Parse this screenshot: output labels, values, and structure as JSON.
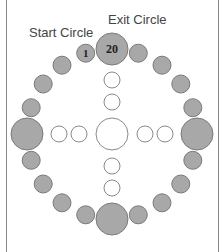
{
  "labels": {
    "start": "Start Circle",
    "exit": "Exit Circle"
  },
  "colors": {
    "ring_fill": "#a8a8a8",
    "ring_stroke": "#7a7a7a",
    "inner_fill": "#ffffff",
    "inner_stroke": "#8a8a8a"
  },
  "ring": {
    "center": [
      112,
      134
    ],
    "radius": 85,
    "count": 20,
    "small_r": 9,
    "big_r": 16,
    "big_indices": [
      0,
      5,
      10,
      15
    ],
    "numbered": {
      "0": "20",
      "19": "1"
    }
  },
  "inner": {
    "center_r": 16,
    "small_r": 8,
    "circles": [
      [
        112,
        80
      ],
      [
        112,
        102
      ],
      [
        112,
        166
      ],
      [
        112,
        188
      ],
      [
        59,
        134
      ],
      [
        79,
        134
      ],
      [
        145,
        134
      ],
      [
        165,
        134
      ]
    ]
  }
}
